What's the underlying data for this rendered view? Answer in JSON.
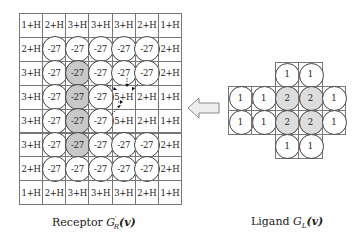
{
  "receptor": {
    "caption_prefix": "Receptor ",
    "caption_symbol": "G′_R(v)",
    "caption_symbol_main": "G",
    "caption_symbol_sup": "′",
    "caption_symbol_sub": "R",
    "caption_symbol_arg": "(v)",
    "rows": [
      [
        "1+H",
        "2+H",
        "3+H",
        "3+H",
        "3+H",
        "2+H",
        "1+H"
      ],
      [
        "2+H",
        "-27",
        "-27",
        "-27",
        "-27",
        "-27",
        "2+H"
      ],
      [
        "3+H",
        "-27",
        "-27",
        "-27",
        "-27",
        "-27",
        "2+H"
      ],
      [
        "3+H",
        "-27",
        "-27",
        "-27",
        "5+H",
        "2+H",
        "1+H"
      ],
      [
        "3+H",
        "-27",
        "-27",
        "-27",
        "5+H",
        "2+H",
        "1+H"
      ],
      [
        "3+H",
        "-27",
        "-27",
        "-27",
        "-27",
        "-27",
        "2+H"
      ],
      [
        "2+H",
        "-27",
        "-27",
        "-27",
        "-27",
        "-27",
        "2+H"
      ],
      [
        "1+H",
        "2+H",
        "3+H",
        "3+H",
        "3+H",
        "2+H",
        "1+H"
      ]
    ],
    "circles": [
      [
        0,
        0,
        0,
        0,
        0,
        0,
        0
      ],
      [
        0,
        1,
        1,
        1,
        1,
        1,
        0
      ],
      [
        0,
        1,
        2,
        1,
        1,
        1,
        0
      ],
      [
        0,
        1,
        2,
        1,
        0,
        0,
        0
      ],
      [
        0,
        1,
        2,
        1,
        0,
        0,
        0
      ],
      [
        0,
        1,
        2,
        1,
        1,
        1,
        0
      ],
      [
        0,
        1,
        1,
        1,
        1,
        1,
        0
      ],
      [
        0,
        0,
        0,
        0,
        0,
        0,
        0
      ]
    ],
    "pocket_cell": {
      "row": 3,
      "col": 4,
      "note": "dashed arrows pointing into cell"
    }
  },
  "ligand": {
    "caption_prefix": "Ligand ",
    "caption_symbol_main": "G",
    "caption_symbol_sub": "L",
    "caption_symbol_arg": "(v)",
    "rows": [
      [
        "",
        "",
        "1",
        "1",
        ""
      ],
      [
        "1",
        "1",
        "2",
        "2",
        "1"
      ],
      [
        "1",
        "1",
        "2",
        "2",
        "1"
      ],
      [
        "",
        "",
        "1",
        "1",
        ""
      ]
    ],
    "highlight": [
      [
        0,
        0,
        0,
        0,
        0
      ],
      [
        0,
        0,
        1,
        1,
        0
      ],
      [
        0,
        0,
        1,
        1,
        0
      ],
      [
        0,
        0,
        0,
        0,
        0
      ]
    ]
  },
  "arrow": {
    "icon": "left-arrow-icon",
    "direction": "left"
  },
  "colors": {
    "grid_line": "#777777",
    "circle_border": "#444444",
    "highlight_receptor": "#c8c8c8",
    "highlight_ligand": "#dddddd"
  }
}
